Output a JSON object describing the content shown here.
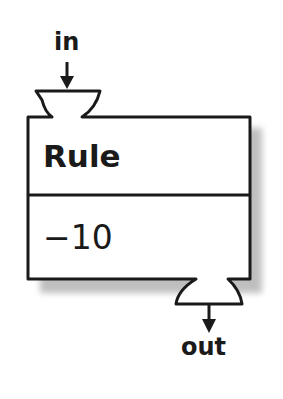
{
  "diagram": {
    "input_label": "in",
    "output_label": "out",
    "block": {
      "title": "Rule",
      "value": "−10"
    },
    "colors": {
      "stroke": "#1a1a1a",
      "fill": "#ffffff",
      "shadow": "#9a9a9a"
    }
  }
}
